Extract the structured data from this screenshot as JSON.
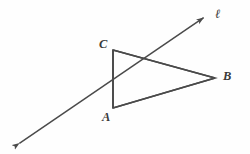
{
  "figure": {
    "background_color": "#fefefe",
    "stroke_color": "#4a4a4a",
    "label_color": "#3a3a3a",
    "stroke_width": 1.6,
    "labels": {
      "vertex_a": "A",
      "vertex_b": "B",
      "vertex_c": "C",
      "line": "ℓ"
    },
    "geometry": {
      "triangle": {
        "points": "113,50 215,78 113,108",
        "vertices": {
          "A": {
            "x": 113,
            "y": 108
          },
          "B": {
            "x": 215,
            "y": 78
          },
          "C": {
            "x": 113,
            "y": 50
          }
        },
        "edges": [
          {
            "name": "CB",
            "from": "C",
            "to": "B"
          },
          {
            "name": "BA",
            "from": "B",
            "to": "A"
          },
          {
            "name": "AC",
            "from": "A",
            "to": "C"
          }
        ]
      },
      "line_l": {
        "start": {
          "x": 14,
          "y": 147
        },
        "end": {
          "x": 209,
          "y": 14
        },
        "arrowheads": "both",
        "intersections": [
          {
            "edge": "AC",
            "x": 113,
            "y": 85
          },
          {
            "edge": "CB",
            "x": 148,
            "y": 61
          }
        ]
      }
    }
  }
}
